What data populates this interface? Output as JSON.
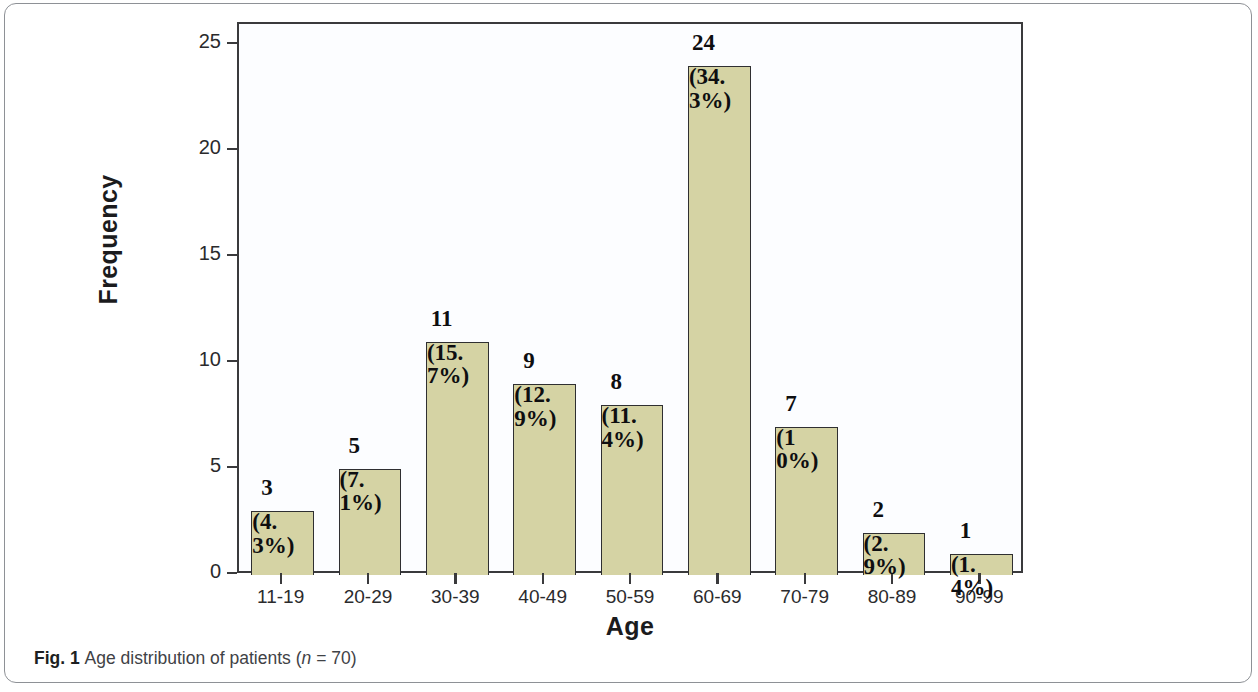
{
  "figure": {
    "caption_prefix": "Fig. 1",
    "caption_text": "Age distribution of patients",
    "caption_n_italic": "n",
    "caption_n_value": "= 70)",
    "caption_open_paren": "("
  },
  "chart_data": {
    "type": "bar",
    "title": "",
    "xlabel": "Age",
    "ylabel": "Frequency",
    "categories": [
      "11-19",
      "20-29",
      "30-39",
      "40-49",
      "50-59",
      "60-69",
      "70-79",
      "80-89",
      "90-99"
    ],
    "values": [
      3,
      5,
      11,
      9,
      8,
      24,
      7,
      2,
      1
    ],
    "value_labels": [
      "3",
      "5",
      "11",
      "9",
      "8",
      "24",
      "7",
      "2",
      "1"
    ],
    "percent_labels": [
      "(4.3%)",
      "(7.1%)",
      "(15.7%)",
      "(12.9%)",
      "(11.4%)",
      "(34.3%)",
      "(10%)",
      "(2.9%)",
      "(1.4%)"
    ],
    "percents": [
      4.3,
      7.1,
      15.7,
      12.9,
      11.4,
      34.3,
      10,
      2.9,
      1.4
    ],
    "ylim": [
      0,
      26
    ],
    "yticks": [
      "0",
      "5",
      "10",
      "15",
      "20",
      "25"
    ],
    "ytick_values": [
      0,
      5,
      10,
      15,
      20,
      25
    ],
    "grid": false,
    "legend": "none",
    "bar_color": "#d5d3a4",
    "bar_edge_color": "#2f2f31",
    "axis_color": "#3a3a3c",
    "plot_background": "#fcfdff",
    "total_n": 70
  }
}
